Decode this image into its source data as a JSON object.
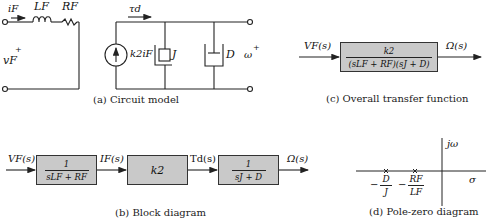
{
  "circuit_model": {
    "caption": "(a) Circuit model",
    "labels": {
      "current": "i_F",
      "current_display": "iF",
      "inductor": "LF",
      "resistor": "RF",
      "voltage": "vF",
      "voltage_sign": "+",
      "source": "k2iF",
      "torque": "τd",
      "inertia": "J",
      "damper": "D",
      "omega": "ω",
      "omega_sign": "+"
    }
  },
  "transfer_function": {
    "caption": "(c) Overall transfer function",
    "input": "VF(s)",
    "output": "Ω(s)",
    "numerator": "k2",
    "denominator": "(sLF + RF)(sJ + D)"
  },
  "block_diagram": {
    "caption": "(b) Block diagram",
    "signals": [
      "VF(s)",
      "IF(s)",
      "Td(s)",
      "Ω(s)"
    ],
    "blocks": [
      {
        "numerator": "1",
        "denominator": "sLF + RF"
      },
      {
        "single": "k2"
      },
      {
        "numerator": "1",
        "denominator": "sJ + D"
      }
    ]
  },
  "pole_zero": {
    "caption": "(d) Pole-zero diagram",
    "imag_axis": "jω",
    "real_axis": "σ",
    "poles": [
      {
        "sign": "−",
        "numerator": "D",
        "denominator": "J"
      },
      {
        "sign": "−",
        "numerator": "RF",
        "denominator": "LF"
      }
    ]
  }
}
